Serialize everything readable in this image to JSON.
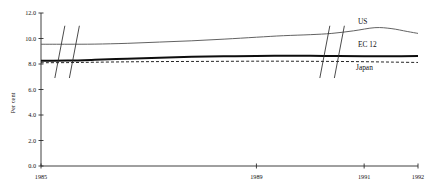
{
  "chart_data": {
    "type": "line",
    "title": "",
    "xlabel": "",
    "ylabel": "Per cent",
    "xlim": [
      1985,
      1992
    ],
    "ylim": [
      0.0,
      12.0
    ],
    "grid": false,
    "legend_position": "right-inline",
    "x_ticks": [
      {
        "value": 1985,
        "label": "1985"
      },
      {
        "value": 1989,
        "label": "1989"
      },
      {
        "value": 1991,
        "label": "1991"
      },
      {
        "value": 1992,
        "label": "1992"
      }
    ],
    "y_ticks": [
      {
        "value": 0.0,
        "label": "0.0"
      },
      {
        "value": 2.0,
        "label": "2.0"
      },
      {
        "value": 4.0,
        "label": "4.0"
      },
      {
        "value": 6.0,
        "label": "6.0"
      },
      {
        "value": 8.0,
        "label": "8.0"
      },
      {
        "value": 10.0,
        "label": "10.0"
      },
      {
        "value": 12.0,
        "label": "12.0"
      }
    ],
    "axis_breaks": [
      {
        "label": "break-1",
        "x_start": 1985.35,
        "x_end": 1985.62
      },
      {
        "label": "break-2",
        "x_start": 1990.27,
        "x_end": 1990.54
      }
    ],
    "series": [
      {
        "name": "US",
        "style": "thin-solid-gray",
        "color": "#5a5a5a",
        "x": [
          1985.0,
          1985.5,
          1986.0,
          1986.6,
          1987.2,
          1987.8,
          1988.4,
          1989.0,
          1989.5,
          1990.0,
          1990.4,
          1990.8,
          1991.2,
          1991.5,
          1991.8,
          1992.0
        ],
        "values": [
          9.55,
          9.55,
          9.56,
          9.62,
          9.72,
          9.82,
          9.95,
          10.1,
          10.22,
          10.3,
          10.4,
          10.6,
          10.85,
          10.78,
          10.55,
          10.4
        ]
      },
      {
        "name": "EC 12",
        "style": "thick-solid-black",
        "color": "#0d0d0d",
        "x": [
          1985.0,
          1985.5,
          1986.0,
          1986.6,
          1987.2,
          1987.8,
          1988.4,
          1989.0,
          1989.5,
          1990.0,
          1990.5,
          1991.0,
          1991.5,
          1992.0
        ],
        "values": [
          8.25,
          8.27,
          8.33,
          8.42,
          8.5,
          8.56,
          8.6,
          8.63,
          8.64,
          8.64,
          8.62,
          8.6,
          8.6,
          8.62
        ]
      },
      {
        "name": "Japan",
        "style": "dashed-black",
        "color": "#1a1a1a",
        "x": [
          1985.0,
          1985.5,
          1986.0,
          1986.6,
          1987.2,
          1987.8,
          1988.4,
          1989.0,
          1989.5,
          1990.0,
          1990.5,
          1991.0,
          1991.5,
          1992.0
        ],
        "values": [
          8.1,
          8.11,
          8.14,
          8.17,
          8.19,
          8.2,
          8.21,
          8.22,
          8.22,
          8.21,
          8.2,
          8.18,
          8.15,
          8.12
        ]
      }
    ],
    "series_labels": [
      {
        "name": "US",
        "text": "US"
      },
      {
        "name": "EC 12",
        "text": "EC 12"
      },
      {
        "name": "Japan",
        "text": "Japan"
      }
    ]
  }
}
